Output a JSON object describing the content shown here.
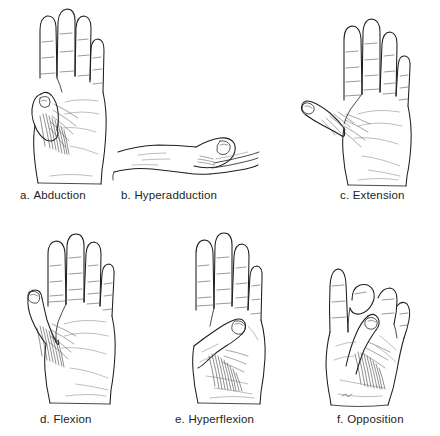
{
  "figure": {
    "background_color": "#ffffff",
    "ink_color": "#1e1e1e",
    "caption_color": "#1d1d1d",
    "style": "anatomical line drawing",
    "panel_count": 6,
    "rows": 2,
    "columns": 3
  },
  "panels": [
    {
      "id": "panel-a",
      "letter": "a.",
      "name": "Abduction",
      "view": "palmar view of right hand, fingers together and extended, thumb moved away from palm in the plane of the palm",
      "icon": "hand-abduction-icon",
      "caption_x": 20,
      "caption_y": 190,
      "art_x": 10,
      "art_y": 6
    },
    {
      "id": "panel-b",
      "letter": "b.",
      "name": "Hyperadduction",
      "view": "lateral view of hand lying flat, thumb drawn across and over the palm",
      "icon": "hand-hyperadduction-icon",
      "caption_x": 121,
      "caption_y": 190,
      "art_x": 112,
      "art_y": 126
    },
    {
      "id": "panel-c",
      "letter": "c.",
      "name": "Extension",
      "view": "palmar view of hand with fingers spread and thumb extended laterally away from the index finger",
      "icon": "hand-extension-icon",
      "caption_x": 340,
      "caption_y": 190,
      "art_x": 300,
      "art_y": 10
    },
    {
      "id": "panel-d",
      "letter": "d.",
      "name": "Flexion",
      "view": "palmar view of hand, thumb flexed and drawn in toward the index finger along the palm",
      "icon": "hand-flexion-icon",
      "caption_x": 40,
      "caption_y": 414,
      "art_x": 14,
      "art_y": 228
    },
    {
      "id": "panel-e",
      "letter": "e.",
      "name": "Hyperflexion",
      "view": "palmar view of hand, thumb folded diagonally across the palm toward the base of the little finger",
      "icon": "hand-hyperflexion-icon",
      "caption_x": 175,
      "caption_y": 414,
      "art_x": 166,
      "art_y": 228
    },
    {
      "id": "panel-f",
      "letter": "f.",
      "name": "Opposition",
      "view": "palmar view of hand, thumb tip brought across to touch the tip of the middle finger",
      "icon": "hand-opposition-icon",
      "caption_x": 337,
      "caption_y": 414,
      "art_x": 312,
      "art_y": 228
    }
  ]
}
